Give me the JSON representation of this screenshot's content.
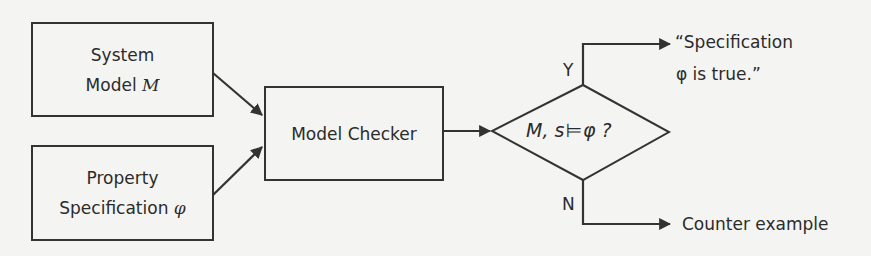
{
  "diagram": {
    "type": "flowchart",
    "nodes": {
      "system_model": {
        "line1": "System",
        "line2_prefix": "Model ",
        "line2_symbol": "M"
      },
      "property_spec": {
        "line1": "Property",
        "line2_prefix": "Specification ",
        "line2_symbol": "φ"
      },
      "model_checker": {
        "label": "Model Checker"
      },
      "decision": {
        "pre": "M, s",
        "models_symbol": "⊨",
        "post": "φ ?"
      },
      "output_true": {
        "line1": "“Specification",
        "line2": "φ is true.”"
      },
      "output_false": {
        "label": "Counter example"
      }
    },
    "branches": {
      "yes": "Y",
      "no": "N"
    },
    "edges": [
      {
        "from": "system_model",
        "to": "model_checker"
      },
      {
        "from": "property_spec",
        "to": "model_checker"
      },
      {
        "from": "model_checker",
        "to": "decision"
      },
      {
        "from": "decision",
        "to": "output_true",
        "label": "Y"
      },
      {
        "from": "decision",
        "to": "output_false",
        "label": "N"
      }
    ],
    "colors": {
      "stroke": "#333333",
      "text": "#2b2b2b",
      "background": "#f4f4f2"
    }
  }
}
